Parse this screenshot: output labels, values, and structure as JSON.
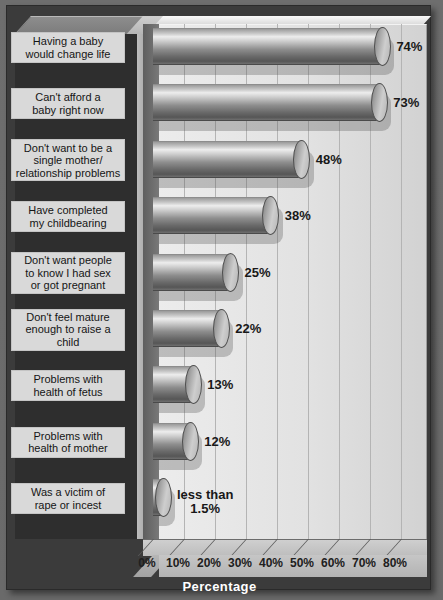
{
  "chart_data": {
    "type": "bar",
    "orientation": "horizontal",
    "title": "",
    "xlabel": "Percentage",
    "ylabel": "",
    "xlim": [
      0,
      85
    ],
    "grid": true,
    "legend": null,
    "xticks": [
      "0%",
      "10%",
      "20%",
      "30%",
      "40%",
      "50%",
      "60%",
      "70%",
      "80%"
    ],
    "xtick_values": [
      0,
      10,
      20,
      30,
      40,
      50,
      60,
      70,
      80
    ],
    "categories": [
      "Having a baby would change life",
      "Can't afford a baby right now",
      "Don't want to be a single mother/ relationship problems",
      "Have completed my childbearing",
      "Don't want people to know I had sex or got pregnant",
      "Don't feel mature enough to raise a child",
      "Problems with health of fetus",
      "Problems with health of mother",
      "Was a victim of rape or incest"
    ],
    "values": [
      74,
      73,
      48,
      38,
      25,
      22,
      13,
      12,
      1.5
    ],
    "data_labels": [
      "74%",
      "73%",
      "48%",
      "38%",
      "25%",
      "22%",
      "13%",
      "12%",
      "less than 1.5%"
    ]
  },
  "axis": {
    "x_title": "Percentage",
    "ticks": [
      {
        "label": "0%"
      },
      {
        "label": "10%"
      },
      {
        "label": "20%"
      },
      {
        "label": "30%"
      },
      {
        "label": "40%"
      },
      {
        "label": "50%"
      },
      {
        "label": "60%"
      },
      {
        "label": "70%"
      },
      {
        "label": "80%"
      }
    ]
  },
  "bars": [
    {
      "label_line1": "Having a baby",
      "label_line2": "would change life",
      "label_line3": "",
      "value": 74,
      "data_label": "74%",
      "data_label_line2": ""
    },
    {
      "label_line1": "Can't afford a",
      "label_line2": "baby right now",
      "label_line3": "",
      "value": 73,
      "data_label": "73%",
      "data_label_line2": ""
    },
    {
      "label_line1": "Don't want to be a",
      "label_line2": "single mother/",
      "label_line3": "relationship problems",
      "value": 48,
      "data_label": "48%",
      "data_label_line2": ""
    },
    {
      "label_line1": "Have completed",
      "label_line2": "my childbearing",
      "label_line3": "",
      "value": 38,
      "data_label": "38%",
      "data_label_line2": ""
    },
    {
      "label_line1": "Don't want people",
      "label_line2": "to know I had sex",
      "label_line3": "or got pregnant",
      "value": 25,
      "data_label": "25%",
      "data_label_line2": ""
    },
    {
      "label_line1": "Don't feel mature",
      "label_line2": "enough to raise a",
      "label_line3": "child",
      "value": 22,
      "data_label": "22%",
      "data_label_line2": ""
    },
    {
      "label_line1": "Problems with",
      "label_line2": "health of fetus",
      "label_line3": "",
      "value": 13,
      "data_label": "13%",
      "data_label_line2": ""
    },
    {
      "label_line1": "Problems with",
      "label_line2": "health of mother",
      "label_line3": "",
      "value": 12,
      "data_label": "12%",
      "data_label_line2": ""
    },
    {
      "label_line1": "Was a victim of",
      "label_line2": "rape or incest",
      "label_line3": "",
      "value": 1.5,
      "data_label": "less than",
      "data_label_line2": "1.5%"
    }
  ],
  "colors": {
    "background": "#3b3b3b",
    "plot_area": "#e6e6e6",
    "bar_light": "#ededed",
    "bar_dark": "#565656",
    "label_box": "#d9d9d9",
    "text": "#151515",
    "axis_title_text": "#ffffff",
    "gridline": "#b4b4b4"
  }
}
